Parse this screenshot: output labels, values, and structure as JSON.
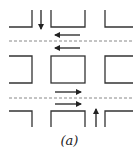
{
  "diagram": {
    "caption": "(a)",
    "colors": {
      "line": "#222222",
      "dashed": "#888888",
      "background": "#ffffff"
    },
    "arrows": [
      {
        "name": "down-arrow-top-left-street",
        "direction": "down"
      },
      {
        "name": "left-arrow-upper-lane-1",
        "direction": "left"
      },
      {
        "name": "left-arrow-upper-lane-2",
        "direction": "left"
      },
      {
        "name": "right-arrow-lower-lane-1",
        "direction": "right"
      },
      {
        "name": "right-arrow-lower-lane-2",
        "direction": "right"
      },
      {
        "name": "up-arrow-bottom-right-street",
        "direction": "up"
      }
    ]
  }
}
